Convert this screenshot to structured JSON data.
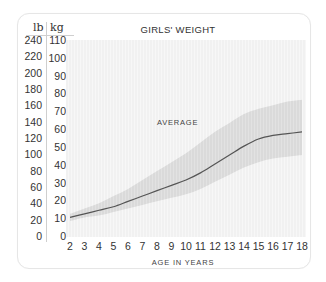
{
  "chart_data": {
    "type": "line",
    "title": "GIRLS' WEIGHT",
    "xlabel": "AGE IN YEARS",
    "ylabel_left": "lb",
    "ylabel_right": "kg",
    "x": [
      2,
      3,
      4,
      5,
      6,
      7,
      8,
      9,
      10,
      11,
      12,
      13,
      14,
      15,
      16,
      17,
      18
    ],
    "xlim": [
      2,
      18
    ],
    "ylim_kg": [
      0,
      110
    ],
    "ylim_lb": [
      0,
      240
    ],
    "yticks_kg": [
      0,
      10,
      20,
      30,
      40,
      50,
      60,
      70,
      80,
      90,
      100,
      110
    ],
    "yticks_lb": [
      0,
      20,
      40,
      60,
      80,
      100,
      120,
      140,
      160,
      180,
      200,
      220,
      240
    ],
    "annotation": "AVERAGE",
    "series": [
      {
        "name": "Average",
        "unit": "kg",
        "values": [
          11,
          13,
          15,
          17,
          20,
          23,
          26,
          29,
          32,
          36,
          41,
          46,
          51,
          55,
          57,
          58,
          59
        ]
      },
      {
        "name": "Upper range",
        "unit": "kg",
        "values": [
          13,
          16,
          19,
          23,
          27,
          32,
          37,
          42,
          47,
          53,
          59,
          64,
          69,
          72,
          74,
          76,
          77
        ]
      },
      {
        "name": "Lower range",
        "unit": "kg",
        "values": [
          9,
          11,
          12,
          14,
          16,
          18,
          20,
          22,
          24,
          27,
          31,
          35,
          39,
          42,
          44,
          45,
          46
        ]
      }
    ],
    "grid": false,
    "legend": "none",
    "colors": {
      "line": "#555555",
      "band": "#d9d9d9",
      "background": "#f6f6f6"
    }
  }
}
